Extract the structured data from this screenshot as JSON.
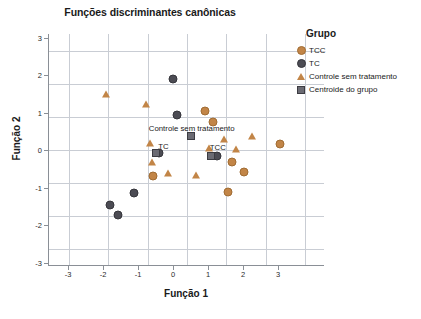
{
  "chart_data": {
    "type": "scatter",
    "title": "Funções discriminantes canônicas",
    "xlabel": "Função 1",
    "ylabel": "Função 2",
    "xlim": [
      -3.5,
      3.5
    ],
    "ylim": [
      -3.5,
      3.5
    ],
    "xticks": [
      "-3",
      "-2",
      "-1",
      "0",
      "1",
      "2",
      "3"
    ],
    "xtick_values": [
      -3,
      -2,
      -1,
      0,
      1,
      2,
      3
    ],
    "yticks": [
      "3",
      "2",
      "1",
      "0",
      "-1",
      "-2",
      "-3"
    ],
    "ytick_values": [
      3,
      2,
      1,
      0,
      -1,
      -2,
      -3
    ],
    "grid": true,
    "legend_position": "right",
    "legend_title": "Grupo",
    "legend": [
      {
        "label": "TCC",
        "marker": "circle",
        "color": "#c28547"
      },
      {
        "label": "TC",
        "marker": "circle",
        "color": "#4c4c54"
      },
      {
        "label": "Controle sem tratamento",
        "marker": "triangle",
        "color": "#c28547"
      },
      {
        "label": "Centroide do grupo",
        "marker": "square",
        "color": "#6b6b73"
      }
    ],
    "series": [
      {
        "name": "TCC",
        "marker": "circle",
        "color": "#c28547",
        "points": [
          [
            0.45,
            1.18
          ],
          [
            0.65,
            0.85
          ],
          [
            2.35,
            0.17
          ],
          [
            1.15,
            -0.35
          ],
          [
            1.45,
            -0.65
          ],
          [
            1.05,
            -1.28
          ],
          [
            -0.85,
            -0.78
          ]
        ]
      },
      {
        "name": "TC",
        "marker": "circle",
        "color": "#4c4c54",
        "points": [
          [
            -0.35,
            2.15
          ],
          [
            -0.25,
            1.05
          ],
          [
            -0.72,
            -0.08
          ],
          [
            0.75,
            -0.18
          ],
          [
            -1.35,
            -1.3
          ],
          [
            -1.95,
            -1.65
          ],
          [
            -1.75,
            -1.95
          ]
        ]
      },
      {
        "name": "Controle sem tratamento",
        "marker": "triangle",
        "color": "#c28547",
        "points": [
          [
            -2.05,
            1.68
          ],
          [
            -1.05,
            1.38
          ],
          [
            -0.95,
            0.2
          ],
          [
            -0.9,
            -0.35
          ],
          [
            -0.48,
            -0.68
          ],
          [
            0.22,
            -0.75
          ],
          [
            0.55,
            0.05
          ],
          [
            0.95,
            0.32
          ],
          [
            1.25,
            0.02
          ],
          [
            1.65,
            0.42
          ]
        ]
      },
      {
        "name": "Centroide do grupo",
        "marker": "square",
        "color": "#6b6b73",
        "points": [
          [
            -0.78,
            -0.08
          ],
          [
            0.62,
            -0.18
          ],
          [
            0.1,
            0.42
          ]
        ]
      }
    ],
    "annotations": [
      {
        "text": "Controle sem tratamento",
        "x": 0.12,
        "y": 0.62
      },
      {
        "text": "TC",
        "x": -0.6,
        "y": 0.1
      },
      {
        "text": "TCC",
        "x": 0.78,
        "y": 0.05
      }
    ]
  }
}
